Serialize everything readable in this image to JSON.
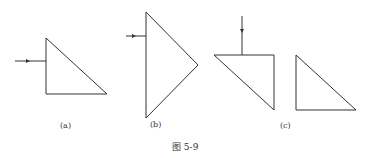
{
  "figure": {
    "caption": "图 5-9",
    "line_color": "#333333",
    "panels": [
      {
        "id": "a",
        "label": "(a)",
        "shapes": [
          {
            "type": "triangle",
            "points": [
              [
                46,
                38
              ],
              [
                46,
                94
              ],
              [
                107,
                94
              ]
            ]
          }
        ],
        "arrows": [
          {
            "from": [
              15,
              61
            ],
            "to": [
              46,
              61
            ],
            "direction": "right"
          }
        ]
      },
      {
        "id": "b",
        "label": "(b)",
        "shapes": [
          {
            "type": "triangle",
            "points": [
              [
                146,
                12
              ],
              [
                146,
                118
              ],
              [
                198,
                65
              ]
            ]
          }
        ],
        "arrows": [
          {
            "from": [
              126,
              36
            ],
            "to": [
              146,
              36
            ],
            "direction": "right"
          }
        ]
      },
      {
        "id": "c",
        "label": "(c)",
        "shapes": [
          {
            "type": "triangle",
            "points": [
              [
                214,
                55
              ],
              [
                274,
                55
              ],
              [
                274,
                110
              ]
            ]
          },
          {
            "type": "triangle",
            "points": [
              [
                296,
                55
              ],
              [
                296,
                110
              ],
              [
                356,
                110
              ]
            ]
          }
        ],
        "arrows": [
          {
            "from": [
              242,
              16
            ],
            "to": [
              242,
              55
            ],
            "direction": "down"
          }
        ]
      }
    ]
  }
}
